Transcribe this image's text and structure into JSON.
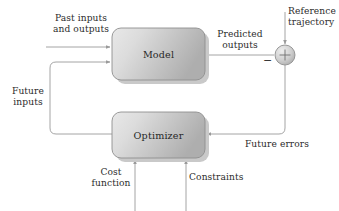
{
  "diagram": {
    "type": "block-diagram",
    "background_color": "#ffffff",
    "line_color": "#9a9a9a",
    "text_color": "#2b2b2b",
    "block_fill_light": "#e3e3e3",
    "block_fill_dark": "#b4b4b4",
    "block_border": "#8f8f8f",
    "shadow_color": "#c9c9c9"
  },
  "blocks": [
    {
      "id": "model",
      "label": "Model",
      "x": 112,
      "y": 28,
      "w": 93,
      "h": 52
    },
    {
      "id": "optimizer",
      "label": "Optimizer",
      "x": 112,
      "y": 112,
      "w": 93,
      "h": 46
    }
  ],
  "junction": {
    "id": "summing-junction",
    "symbol": "+",
    "negative_sign": "−",
    "cx": 285,
    "cy": 55,
    "r": 10
  },
  "labels": {
    "past_inputs": "Past inputs\nand outputs",
    "predicted_outputs": "Predicted\noutputs",
    "reference_trajectory": "Reference\ntrajectory",
    "future_inputs": "Future\ninputs",
    "future_errors": "Future errors",
    "cost_function": "Cost\nfunction",
    "constraints": "Constraints",
    "model": "Model",
    "optimizer": "Optimizer"
  },
  "signals": [
    {
      "name": "past-inputs-and-outputs",
      "from": "external-left",
      "to": "model",
      "direction": "right"
    },
    {
      "name": "future-inputs",
      "from": "optimizer",
      "to": "model",
      "direction": "up-right"
    },
    {
      "name": "predicted-outputs",
      "from": "model",
      "to": "summing-junction",
      "direction": "right"
    },
    {
      "name": "reference-trajectory",
      "from": "external-top",
      "to": "summing-junction",
      "direction": "down"
    },
    {
      "name": "future-errors",
      "from": "summing-junction",
      "to": "optimizer",
      "direction": "down-left"
    },
    {
      "name": "cost-function",
      "from": "external-bottom",
      "to": "optimizer",
      "direction": "up"
    },
    {
      "name": "constraints",
      "from": "external-bottom",
      "to": "optimizer",
      "direction": "up"
    }
  ]
}
